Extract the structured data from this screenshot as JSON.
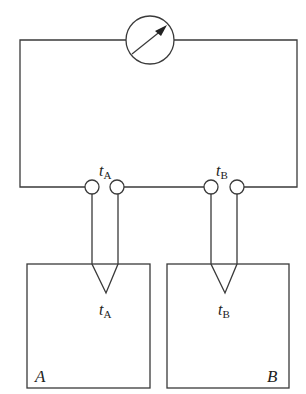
{
  "diagram": {
    "type": "thermocouple measurement circuit",
    "meter": {
      "symbol": "galvanometer-with-arrow"
    },
    "junction_labels": {
      "terminal_A": {
        "var": "t",
        "sub": "A"
      },
      "terminal_B": {
        "var": "t",
        "sub": "B"
      },
      "probe_A": {
        "var": "t",
        "sub": "A"
      },
      "probe_B": {
        "var": "t",
        "sub": "B"
      }
    },
    "blocks": [
      {
        "id": "A",
        "label": "A"
      },
      {
        "id": "B",
        "label": "B"
      }
    ],
    "colors": {
      "line": "#3a3a3a",
      "background": "#ffffff"
    }
  }
}
